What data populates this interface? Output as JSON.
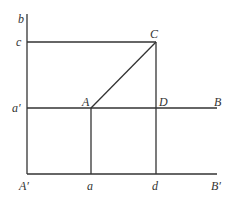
{
  "diagram": {
    "type": "geometry-projection",
    "stroke_color": "#333333",
    "background": "#ffffff",
    "points": {
      "b": {
        "label": "b",
        "x": 27,
        "y": 14
      },
      "c": {
        "label": "c",
        "x": 27,
        "y": 42
      },
      "C": {
        "label": "C",
        "x": 156,
        "y": 42
      },
      "a_prime": {
        "label": "a′",
        "x": 27,
        "y": 108
      },
      "A": {
        "label": "A",
        "x": 91,
        "y": 108
      },
      "D": {
        "label": "D",
        "x": 156,
        "y": 108
      },
      "B": {
        "label": "B",
        "x": 217,
        "y": 108
      },
      "A_prime": {
        "label": "A′",
        "x": 27,
        "y": 174
      },
      "a": {
        "label": "a",
        "x": 91,
        "y": 174
      },
      "d": {
        "label": "d",
        "x": 156,
        "y": 174
      },
      "B_prime": {
        "label": "B′",
        "x": 217,
        "y": 174
      }
    },
    "segments": [
      {
        "from": "b",
        "to": "A_prime",
        "name": "vertical-axis-b"
      },
      {
        "from": "A_prime",
        "to": "B_prime",
        "name": "horizontal-axis-b-prime"
      },
      {
        "from": "a_prime",
        "to": "B",
        "name": "line-a-prime-B"
      },
      {
        "from": "c",
        "to": "C",
        "name": "line-c-C"
      },
      {
        "from": "C",
        "to": "d",
        "name": "line-C-d"
      },
      {
        "from": "A",
        "to": "a",
        "name": "line-A-a"
      },
      {
        "from": "A",
        "to": "C",
        "name": "line-A-C"
      }
    ]
  }
}
